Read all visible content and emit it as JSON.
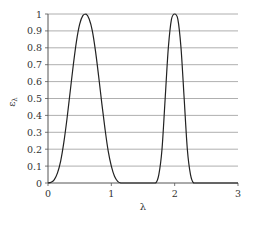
{
  "chart_data": {
    "type": "line",
    "title": "",
    "xlabel": "λ",
    "ylabel": "ελ",
    "xlim": [
      0,
      3
    ],
    "ylim": [
      0,
      1
    ],
    "grid": {
      "y": true,
      "x": false,
      "y_step": 0.1
    },
    "legend": null,
    "x_ticks": [
      "0",
      "1",
      "2",
      "3"
    ],
    "y_ticks": [
      "0",
      "0.1",
      "0.2",
      "0.3",
      "0.4",
      "0.5",
      "0.6",
      "0.7",
      "0.8",
      "0.9",
      "1"
    ],
    "series": [
      {
        "name": "spectral emissivity",
        "x": [
          0.0,
          0.05,
          0.1,
          0.15,
          0.2,
          0.25,
          0.3,
          0.35,
          0.4,
          0.45,
          0.5,
          0.55,
          0.6,
          0.65,
          0.7,
          0.75,
          0.8,
          0.85,
          0.9,
          0.95,
          1.0,
          1.05,
          1.1,
          1.15,
          1.2,
          1.25,
          1.3,
          1.4,
          1.5,
          1.6,
          1.7,
          1.75,
          1.8,
          1.85,
          1.9,
          1.95,
          2.0,
          2.05,
          2.1,
          2.15,
          2.2,
          2.25,
          2.3,
          2.4,
          3.0
        ],
        "values": [
          0.0,
          0.005,
          0.02,
          0.06,
          0.13,
          0.24,
          0.38,
          0.54,
          0.7,
          0.84,
          0.94,
          0.99,
          1.0,
          0.97,
          0.9,
          0.78,
          0.63,
          0.47,
          0.32,
          0.19,
          0.1,
          0.04,
          0.01,
          0.0,
          0.0,
          0.0,
          0.0,
          0.0,
          0.0,
          0.0,
          0.0,
          0.05,
          0.2,
          0.5,
          0.8,
          0.97,
          1.0,
          0.97,
          0.8,
          0.5,
          0.2,
          0.05,
          0.0,
          0.0,
          0.0
        ]
      }
    ],
    "colors": {
      "line": "#222222",
      "grid": "#9a9a9a",
      "axis": "#555555",
      "text": "#333333"
    }
  }
}
